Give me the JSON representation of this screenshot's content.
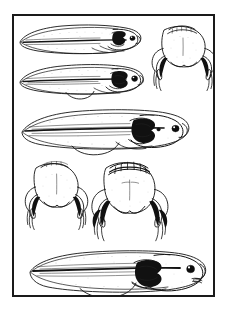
{
  "page": {
    "background_color": "#ffffff",
    "ink_color": "#141414"
  },
  "frame": {
    "name": "plate-border",
    "border_color": "#1a1a1a",
    "border_width_px": 2,
    "fill_color": "#ffffff",
    "x": 12,
    "y": 14,
    "width": 203,
    "height": 283
  },
  "figures": [
    {
      "id": "fig-1",
      "label": "tadpole-lateral-stage-1",
      "view": "lateral",
      "row": 1,
      "column": "left",
      "notes": "Early tadpole, deep tail fin, no visible limbs",
      "bbox": {
        "x": 20,
        "y": 22,
        "width": 118,
        "height": 36
      }
    },
    {
      "id": "fig-2",
      "label": "froglet-dorsal-stage-1",
      "view": "dorsal",
      "row": 1,
      "column": "right",
      "notes": "Dorsal view of froglet head and forelimbs emerging",
      "bbox": {
        "x": 150,
        "y": 20,
        "width": 58,
        "height": 75
      }
    },
    {
      "id": "fig-3",
      "label": "tadpole-lateral-stage-2",
      "view": "lateral",
      "row": 2,
      "column": "left",
      "notes": "Tadpole with hind limb bud and developing head",
      "bbox": {
        "x": 20,
        "y": 60,
        "width": 120,
        "height": 38
      }
    },
    {
      "id": "fig-4",
      "label": "tadpole-lateral-stage-3",
      "view": "lateral",
      "row": 3,
      "column": "full",
      "notes": "Larger tadpole, prominent eye, tail fin reduced",
      "bbox": {
        "x": 22,
        "y": 106,
        "width": 165,
        "height": 44
      }
    },
    {
      "id": "fig-5",
      "label": "froglet-dorsal-stage-2",
      "view": "dorsal",
      "row": 4,
      "column": "left",
      "notes": "Dorsal view, smooth head outline, splayed limbs",
      "bbox": {
        "x": 28,
        "y": 154,
        "width": 64,
        "height": 84
      }
    },
    {
      "id": "fig-6",
      "label": "froglet-dorsal-stage-3",
      "view": "dorsal",
      "row": 4,
      "column": "right",
      "notes": "Dorsal view with banded head crest and four limbs",
      "bbox": {
        "x": 96,
        "y": 152,
        "width": 78,
        "height": 88
      }
    },
    {
      "id": "fig-7",
      "label": "tadpole-lateral-stage-4",
      "view": "lateral",
      "row": 5,
      "column": "full",
      "notes": "Late stage tadpole, large eye, forelimb visible, mouth defined",
      "bbox": {
        "x": 28,
        "y": 246,
        "width": 175,
        "height": 48
      }
    }
  ],
  "caption": ""
}
